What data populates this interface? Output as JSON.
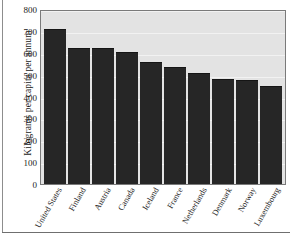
{
  "chart_data": {
    "type": "bar",
    "title": "",
    "xlabel": "",
    "ylabel": "Kilograms per capita per annum",
    "ylim": [
      0,
      800
    ],
    "yticks": [
      0,
      100,
      200,
      300,
      400,
      500,
      600,
      700,
      800
    ],
    "ytick_labels": [
      "0",
      "100",
      "200",
      "300",
      "400",
      "500",
      "600",
      "700",
      "800"
    ],
    "grid": true,
    "legend": "none",
    "categories": [
      "United States",
      "Finland",
      "Austria",
      "Canada",
      "Iceland",
      "France",
      "Netherlands",
      "Denmark",
      "Norway",
      "Luxembourg"
    ],
    "values": [
      710,
      620,
      620,
      605,
      558,
      535,
      507,
      478,
      475,
      450
    ],
    "colors": {
      "bar": "#262626",
      "plot_background": "#e3e3e3",
      "plot_border": "#7a7a7a",
      "gridline": "#f2f2f2",
      "text": "#1b1b1b",
      "page_background": "#ffffff",
      "rule": "#6f6f6f"
    }
  }
}
